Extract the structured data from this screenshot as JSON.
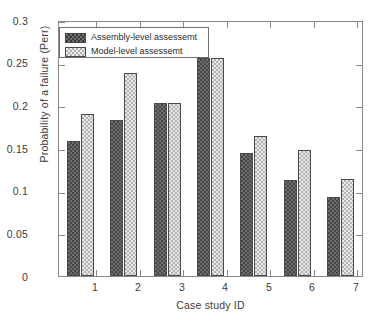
{
  "chart_data": {
    "type": "bar",
    "title": "",
    "xlabel": "Case study ID",
    "ylabel": "Probability of a failure (Perr)",
    "categories": [
      "1",
      "2",
      "3",
      "4",
      "5",
      "6",
      "7"
    ],
    "series": [
      {
        "name": "Assembly-level assessemt",
        "values": [
          0.159,
          0.184,
          0.204,
          0.258,
          0.145,
          0.113,
          0.093
        ]
      },
      {
        "name": "Model-level assessemt",
        "values": [
          0.191,
          0.24,
          0.204,
          0.258,
          0.165,
          0.149,
          0.114
        ]
      }
    ],
    "ylim": [
      0,
      0.3
    ],
    "yticks": [
      "0",
      "0.05",
      "0.1",
      "0.15",
      "0.2",
      "0.25",
      "0.3"
    ],
    "ytick_values": [
      0,
      0.05,
      0.1,
      0.15,
      0.2,
      0.25,
      0.3
    ],
    "grid": false,
    "legend_position": "upper-left",
    "colors": {
      "series_0_fill": "#6e6e6e",
      "series_0_pattern": "#474747",
      "series_1_fill": "#e8e8e8",
      "series_1_pattern": "#b4b4b4",
      "axis": "#8a8a8a",
      "text": "#2b2b2b",
      "background": "#ffffff"
    }
  }
}
